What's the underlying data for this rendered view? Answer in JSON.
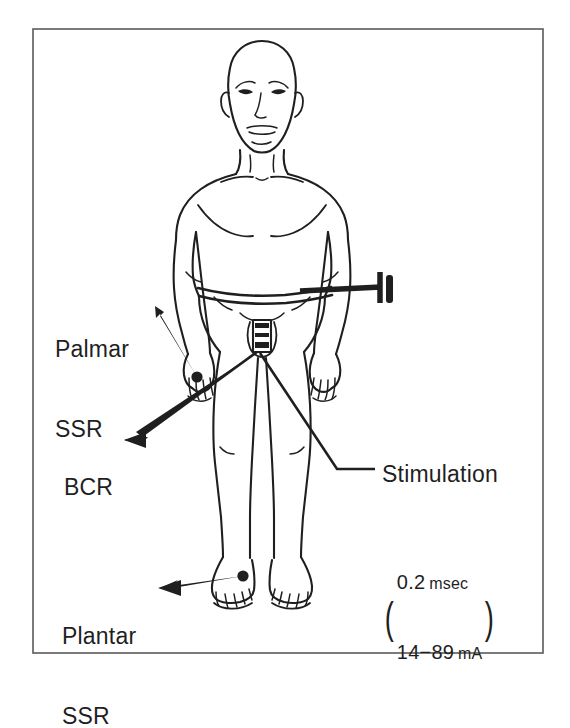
{
  "figure": {
    "frame": {
      "stroke_color": "#4a4a4a",
      "present": true
    },
    "line_color": "#1f1f1f",
    "background": "#ffffff"
  },
  "labels": {
    "palmar": {
      "line1": "Palmar",
      "line2": "SSR"
    },
    "bcr": {
      "line1": "BCR"
    },
    "plantar": {
      "line1": "Plantar",
      "line2": "SSR"
    },
    "stimulation": {
      "title": "Stimulation",
      "param_duration": "0.2",
      "param_duration_unit": "msec",
      "param_current": "14−89",
      "param_current_unit": "mA",
      "paren_open": "(",
      "paren_close": ")"
    }
  },
  "electrodes": [
    {
      "name": "palmar-electrode",
      "site": "right hand / wrist",
      "label": "Palmar SSR"
    },
    {
      "name": "plantar-electrode",
      "site": "right foot dorsum",
      "label": "Plantar SSR"
    },
    {
      "name": "perineal-electrode",
      "site": "perineum / genital region",
      "label": "BCR"
    },
    {
      "name": "waist-ground-belt",
      "site": "waist",
      "label": "ground belt"
    }
  ]
}
